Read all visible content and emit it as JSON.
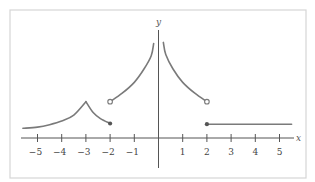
{
  "chart_data": {
    "type": "line",
    "title": "",
    "xlabel": "x",
    "ylabel": "y",
    "xlim": [
      -5.6,
      5.6
    ],
    "ylim": [
      -1.2,
      4.4
    ],
    "grid": false,
    "legend": null,
    "x_ticks": [
      -5,
      -4,
      -3,
      -2,
      -1,
      1,
      2,
      3,
      4,
      5
    ],
    "x_tick_labels": [
      "−5",
      "−4",
      "−3",
      "−2",
      "−1",
      "1",
      "2",
      "3",
      "4",
      "5"
    ],
    "series": [
      {
        "name": "piece-1",
        "description": "increasing curve from the left up to a cusp at x=-3, then decreasing to x=-2",
        "points": [
          [
            -5.6,
            0.4
          ],
          [
            -5,
            0.45
          ],
          [
            -4.5,
            0.55
          ],
          [
            -4,
            0.7
          ],
          [
            -3.5,
            0.95
          ],
          [
            -3,
            1.5
          ],
          [
            -2.7,
            1.05
          ],
          [
            -2.4,
            0.8
          ],
          [
            -2,
            0.6
          ]
        ],
        "end_marker": {
          "x": -2,
          "y": 0.6,
          "type": "closed"
        }
      },
      {
        "name": "piece-2",
        "description": "increasing curve from open circle at x=-2 toward vertical asymptote at x=0",
        "points": [
          [
            -2,
            1.5
          ],
          [
            -1.5,
            1.85
          ],
          [
            -1,
            2.3
          ],
          [
            -0.6,
            2.85
          ],
          [
            -0.3,
            3.4
          ],
          [
            -0.2,
            3.9
          ]
        ],
        "start_marker": {
          "x": -2,
          "y": 1.5,
          "type": "open"
        }
      },
      {
        "name": "piece-3",
        "description": "decreasing curve from vertical asymptote at x=0 to open circle at x=2",
        "points": [
          [
            0.2,
            3.95
          ],
          [
            0.3,
            3.45
          ],
          [
            0.6,
            2.85
          ],
          [
            1,
            2.3
          ],
          [
            1.5,
            1.85
          ],
          [
            2,
            1.5
          ]
        ],
        "end_marker": {
          "x": 2,
          "y": 1.5,
          "type": "open"
        }
      },
      {
        "name": "piece-4",
        "description": "horizontal line starting at closed dot x=2",
        "points": [
          [
            2,
            0.57
          ],
          [
            5.5,
            0.57
          ]
        ],
        "start_marker": {
          "x": 2,
          "y": 0.57,
          "type": "closed"
        }
      }
    ]
  },
  "labels": {
    "x_axis": "x",
    "y_axis": "y"
  }
}
